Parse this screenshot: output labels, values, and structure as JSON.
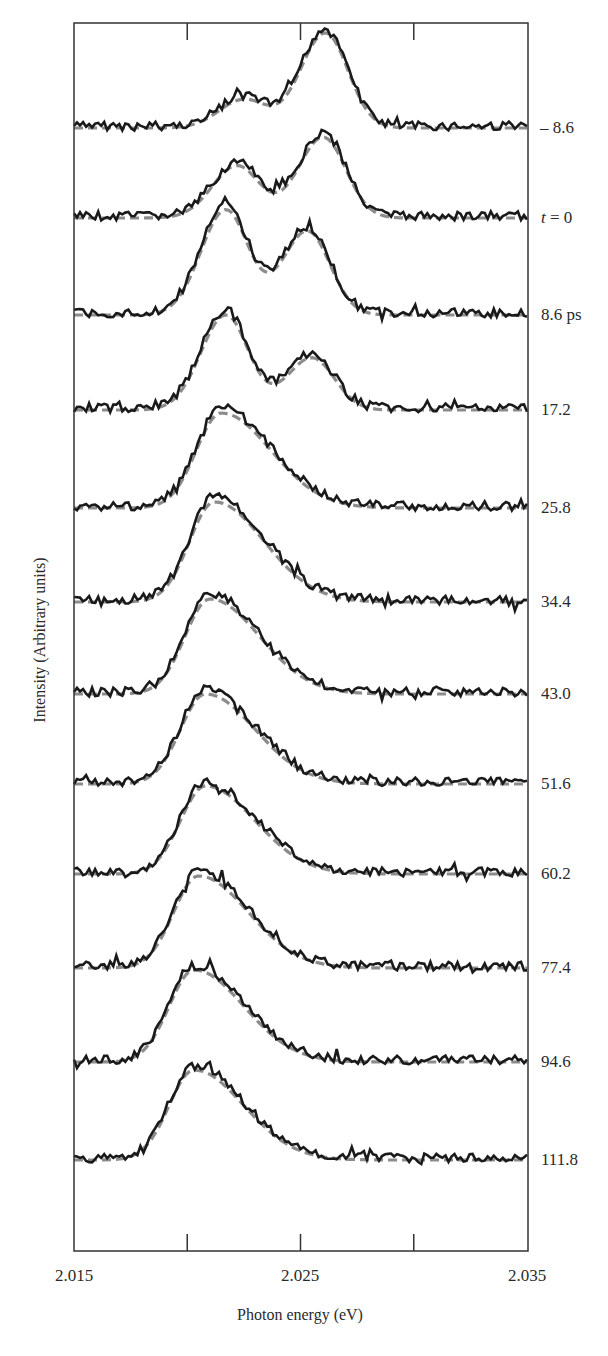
{
  "chart_data": {
    "type": "line",
    "title": "",
    "xlabel": "Photon energy (eV)",
    "ylabel": "Intensity (Arbitrary units)",
    "xlim": [
      2.015,
      2.035
    ],
    "x_ticks": [
      2.015,
      2.02,
      2.025,
      2.03,
      2.035
    ],
    "x_tick_labels": [
      "2.015",
      "",
      "2.025",
      "",
      "2.035"
    ],
    "grid": false,
    "legend": "none; traces labeled on right by time delay",
    "layout": "vertically offset stacked spectra (waterfall); solid black = measured, dashed grey = fit",
    "series": [
      {
        "name": "-8.6",
        "label": "– 8.6",
        "peaks": [
          {
            "x": 2.0225,
            "rel_height": 0.3
          },
          {
            "x": 2.0261,
            "rel_height": 1.0
          }
        ]
      },
      {
        "name": "t = 0",
        "label": "t = 0",
        "peaks": [
          {
            "x": 2.0222,
            "rel_height": 0.55
          },
          {
            "x": 2.026,
            "rel_height": 0.85
          }
        ]
      },
      {
        "name": "8.6 ps",
        "label": "8.6 ps",
        "peaks": [
          {
            "x": 2.0217,
            "rel_height": 1.0
          },
          {
            "x": 2.0253,
            "rel_height": 0.8
          }
        ]
      },
      {
        "name": "17.2",
        "label": "17.2",
        "peaks": [
          {
            "x": 2.0217,
            "rel_height": 1.0
          },
          {
            "x": 2.0255,
            "rel_height": 0.55
          }
        ]
      },
      {
        "name": "25.8",
        "label": "25.8",
        "peaks": [
          {
            "x": 2.0215,
            "rel_height": 1.0
          }
        ]
      },
      {
        "name": "34.4",
        "label": "34.4",
        "peaks": [
          {
            "x": 2.0212,
            "rel_height": 1.0
          }
        ]
      },
      {
        "name": "43.0",
        "label": "43.0",
        "peaks": [
          {
            "x": 2.021,
            "rel_height": 1.0
          }
        ]
      },
      {
        "name": "51.6",
        "label": "51.6",
        "peaks": [
          {
            "x": 2.0208,
            "rel_height": 1.0
          }
        ]
      },
      {
        "name": "60.2",
        "label": "60.2",
        "peaks": [
          {
            "x": 2.0208,
            "rel_height": 1.0
          }
        ]
      },
      {
        "name": "77.4",
        "label": "77.4",
        "peaks": [
          {
            "x": 2.0205,
            "rel_height": 1.0
          }
        ]
      },
      {
        "name": "94.6",
        "label": "94.6",
        "peaks": [
          {
            "x": 2.0203,
            "rel_height": 1.0
          }
        ]
      },
      {
        "name": "111.8",
        "label": "111.8",
        "peaks": [
          {
            "x": 2.0203,
            "rel_height": 1.0
          }
        ]
      }
    ]
  },
  "axes": {
    "xlabel": "Photon energy (eV)",
    "ylabel": "Intensity (Arbitrary units)",
    "tick_labels": [
      "2.015",
      "2.025",
      "2.035"
    ]
  },
  "traces": [
    {
      "label_prefix": "– 8.6",
      "italic": "",
      "suffix": ""
    },
    {
      "label_prefix": "",
      "italic": "t",
      "suffix": " = 0"
    },
    {
      "label_prefix": "8.6 ps",
      "italic": "",
      "suffix": ""
    },
    {
      "label_prefix": "17.2",
      "italic": "",
      "suffix": ""
    },
    {
      "label_prefix": "25.8",
      "italic": "",
      "suffix": ""
    },
    {
      "label_prefix": "34.4",
      "italic": "",
      "suffix": ""
    },
    {
      "label_prefix": "43.0",
      "italic": "",
      "suffix": ""
    },
    {
      "label_prefix": "51.6",
      "italic": "",
      "suffix": ""
    },
    {
      "label_prefix": "60.2",
      "italic": "",
      "suffix": ""
    },
    {
      "label_prefix": "77.4",
      "italic": "",
      "suffix": ""
    },
    {
      "label_prefix": "94.6",
      "italic": "",
      "suffix": ""
    },
    {
      "label_prefix": "111.8",
      "italic": "",
      "suffix": ""
    }
  ],
  "colors": {
    "measured": "#1a1a1a",
    "fit": "#8c8c8c",
    "axis": "#333333"
  }
}
